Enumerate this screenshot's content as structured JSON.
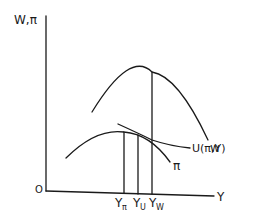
{
  "diagram": {
    "y_axis_label": "W,π",
    "x_axis_label": "Y",
    "origin_label": "O",
    "curves": [
      {
        "name": "W",
        "label": "w"
      },
      {
        "name": "pi",
        "label": "π"
      },
      {
        "name": "U",
        "label": "U(π,Y)"
      }
    ],
    "x_ticks": [
      {
        "label": "Y",
        "sub": "π"
      },
      {
        "label": "Y",
        "sub": "U"
      },
      {
        "label": "Y",
        "sub": "W"
      }
    ],
    "colors": {
      "ink": "#1a1a1a",
      "background": "#ffffff"
    }
  }
}
